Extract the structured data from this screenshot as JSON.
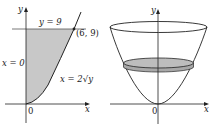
{
  "figures": [
    {
      "name": "region-plot",
      "labels": {
        "y_axis": "y",
        "x_axis": "x",
        "origin": "0",
        "top_line": "y = 9",
        "left_line": "x = 0",
        "point": "(6, 9)",
        "curve": "x = 2√y"
      },
      "colors": {
        "region_fill": "#c8c8c8",
        "stroke": "#222222"
      }
    },
    {
      "name": "solid-of-revolution",
      "labels": {
        "y_axis": "y",
        "x_axis": "x",
        "origin": "0"
      },
      "colors": {
        "disk_fill": "#b4b4b4",
        "disk_edge": "#d0d0d0",
        "stroke": "#222222"
      }
    }
  ]
}
